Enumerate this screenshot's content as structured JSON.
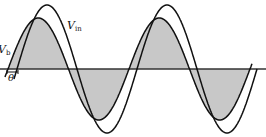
{
  "diagram": {
    "type": "waveform",
    "axis": {
      "y": 69,
      "x_start": 0,
      "x_end": 266
    },
    "colors": {
      "fill": "#c8c8c8",
      "stroke": "#111111",
      "axis": "#333333"
    },
    "waves": [
      {
        "name": "V_in",
        "amplitude": 64,
        "period": 120,
        "phase_x": 17
      },
      {
        "name": "V_b",
        "amplitude": 51,
        "period": 121,
        "phase_x": 8,
        "shaded": true
      }
    ],
    "labels": {
      "vin": {
        "main": "V",
        "sub": "in"
      },
      "vb": {
        "main": "V",
        "sub": "b"
      },
      "theta": "θ"
    }
  }
}
